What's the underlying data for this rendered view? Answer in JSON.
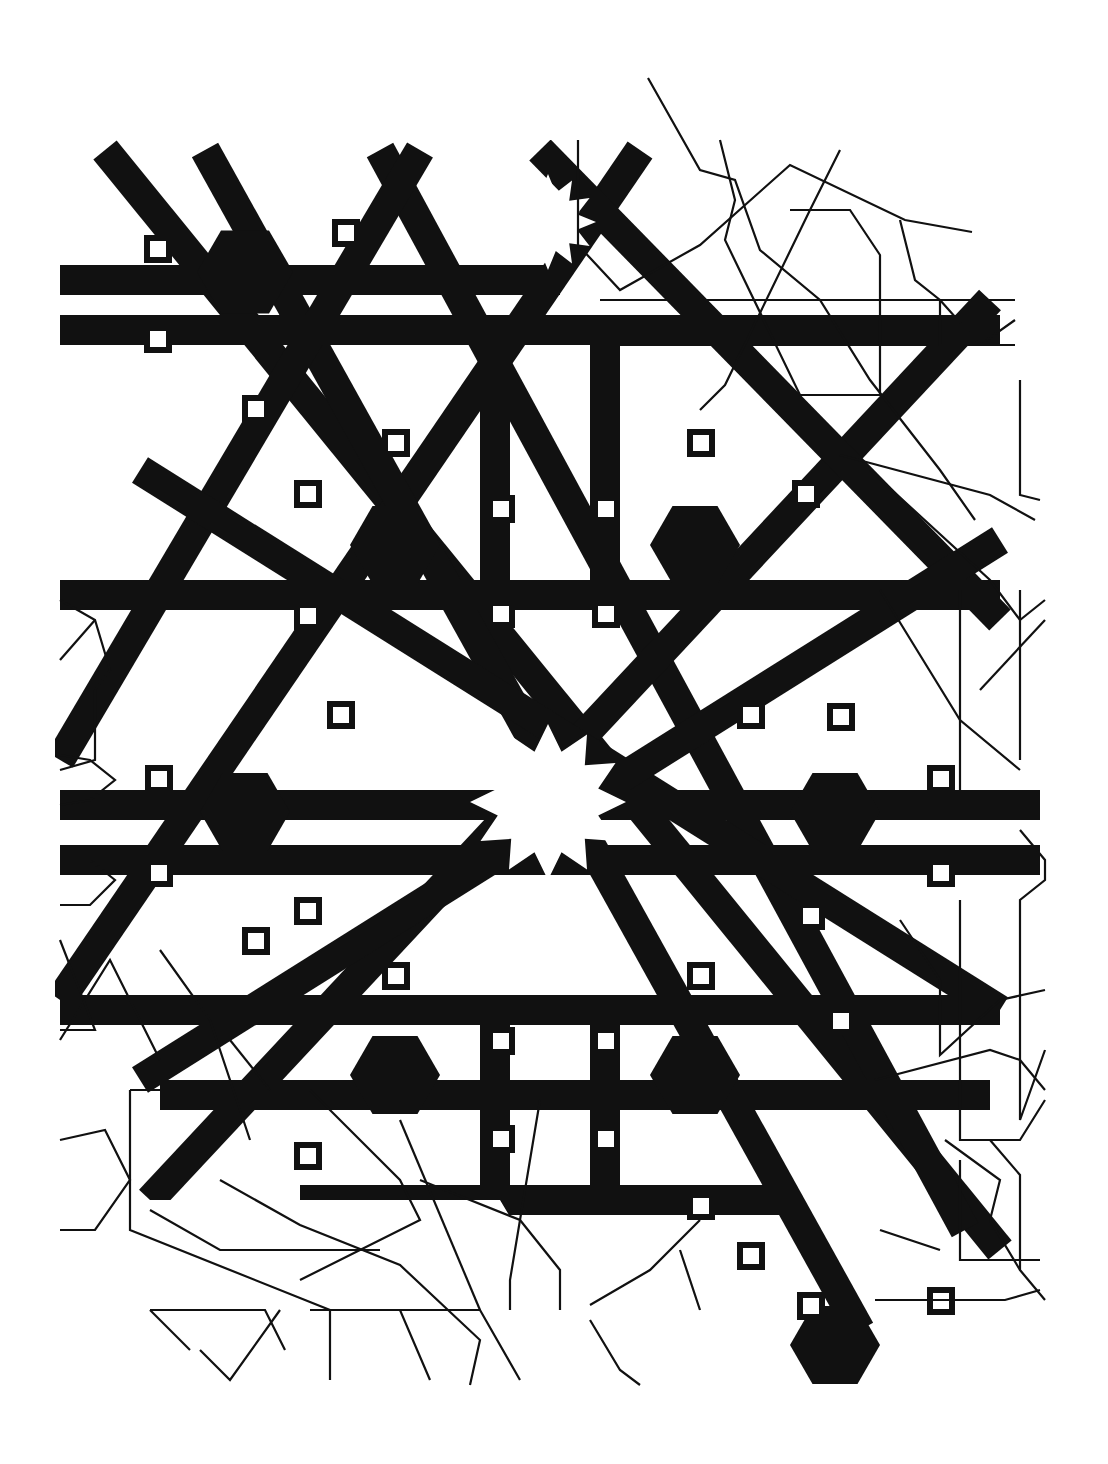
{
  "figure": {
    "title": "",
    "description": "Geometric Islamic star pattern: twelve-point star rosettes with interlaced bands (filled black) on the left/center, and outline construction linework on the right and bottom",
    "background": "#ffffff",
    "ink": "#111111",
    "line_width": 2.2
  },
  "pattern": {
    "rosettes": [
      {
        "cx": 548,
        "cy": 802,
        "r_outer": 78,
        "r_inner": 52,
        "points": 12,
        "style": "filled"
      },
      {
        "cx": 548,
        "cy": 222,
        "r_outer": 48,
        "r_inner": 30,
        "points": 12,
        "style": "white-star"
      }
    ],
    "hexagons": [
      {
        "cx": 245,
        "cy": 272,
        "r": 48
      },
      {
        "cx": 395,
        "cy": 545,
        "r": 45
      },
      {
        "cx": 695,
        "cy": 545,
        "r": 45
      },
      {
        "cx": 245,
        "cy": 812,
        "r": 45
      },
      {
        "cx": 835,
        "cy": 812,
        "r": 45
      },
      {
        "cx": 395,
        "cy": 1075,
        "r": 45
      },
      {
        "cx": 695,
        "cy": 1075,
        "r": 45
      },
      {
        "cx": 835,
        "cy": 1345,
        "r": 45
      }
    ],
    "squares": [
      {
        "x": 147,
        "y": 238
      },
      {
        "x": 147,
        "y": 328
      },
      {
        "x": 335,
        "y": 222
      },
      {
        "x": 245,
        "y": 398
      },
      {
        "x": 385,
        "y": 432
      },
      {
        "x": 297,
        "y": 483
      },
      {
        "x": 490,
        "y": 498
      },
      {
        "x": 595,
        "y": 498
      },
      {
        "x": 490,
        "y": 603
      },
      {
        "x": 595,
        "y": 603
      },
      {
        "x": 690,
        "y": 432
      },
      {
        "x": 795,
        "y": 483
      },
      {
        "x": 297,
        "y": 605
      },
      {
        "x": 330,
        "y": 704
      },
      {
        "x": 148,
        "y": 768
      },
      {
        "x": 148,
        "y": 862
      },
      {
        "x": 930,
        "y": 768
      },
      {
        "x": 930,
        "y": 862
      },
      {
        "x": 740,
        "y": 704
      },
      {
        "x": 830,
        "y": 706
      },
      {
        "x": 297,
        "y": 900
      },
      {
        "x": 385,
        "y": 965
      },
      {
        "x": 245,
        "y": 930
      },
      {
        "x": 690,
        "y": 965
      },
      {
        "x": 800,
        "y": 905
      },
      {
        "x": 830,
        "y": 1010
      },
      {
        "x": 490,
        "y": 1030
      },
      {
        "x": 595,
        "y": 1030
      },
      {
        "x": 490,
        "y": 1128
      },
      {
        "x": 595,
        "y": 1128
      },
      {
        "x": 297,
        "y": 1145
      },
      {
        "x": 690,
        "y": 1195
      },
      {
        "x": 740,
        "y": 1245
      },
      {
        "x": 800,
        "y": 1295
      },
      {
        "x": 930,
        "y": 1290
      }
    ],
    "bands": [
      [
        105,
        150,
        1000,
        1250
      ],
      [
        380,
        150,
        965,
        1230
      ],
      [
        150,
        1200,
        990,
        300
      ],
      [
        60,
        1000,
        640,
        150
      ],
      [
        205,
        150,
        860,
        1330
      ],
      [
        60,
        760,
        420,
        150
      ],
      [
        540,
        150,
        1000,
        620
      ],
      [
        140,
        470,
        1000,
        1010
      ],
      [
        140,
        1080,
        1000,
        540
      ],
      [
        60,
        595,
        1000,
        595
      ],
      [
        60,
        1010,
        1000,
        1010
      ],
      [
        60,
        280,
        560,
        280
      ],
      [
        60,
        330,
        1000,
        330
      ],
      [
        60,
        805,
        1040,
        805
      ],
      [
        60,
        860,
        1040,
        860
      ],
      [
        160,
        1095,
        990,
        1095
      ],
      [
        300,
        1200,
        780,
        1200
      ],
      [
        495,
        330,
        495,
        595
      ],
      [
        605,
        330,
        605,
        595
      ],
      [
        495,
        1010,
        495,
        1200
      ],
      [
        605,
        1010,
        605,
        1200
      ]
    ],
    "band_width": 30
  },
  "overlay": {
    "description": "outline construction lines (unfilled)",
    "polylines": [
      [
        [
          648,
          78
        ],
        [
          700,
          170
        ],
        [
          735,
          180
        ],
        [
          760,
          250
        ],
        [
          820,
          300
        ],
        [
          870,
          380
        ],
        [
          940,
          470
        ],
        [
          975,
          520
        ]
      ],
      [
        [
          578,
          140
        ],
        [
          578,
          245
        ],
        [
          620,
          290
        ],
        [
          700,
          245
        ],
        [
          790,
          165
        ],
        [
          905,
          220
        ],
        [
          972,
          232
        ]
      ],
      [
        [
          600,
          300
        ],
        [
          1015,
          300
        ]
      ],
      [
        [
          600,
          345
        ],
        [
          1015,
          345
        ]
      ],
      [
        [
          720,
          140
        ],
        [
          735,
          200
        ],
        [
          725,
          240
        ],
        [
          800,
          395
        ],
        [
          880,
          395
        ],
        [
          880,
          255
        ],
        [
          850,
          210
        ],
        [
          790,
          210
        ]
      ],
      [
        [
          840,
          150
        ],
        [
          810,
          210
        ],
        [
          725,
          385
        ],
        [
          700,
          410
        ]
      ],
      [
        [
          900,
          220
        ],
        [
          915,
          280
        ],
        [
          940,
          300
        ],
        [
          940,
          345
        ],
        [
          980,
          345
        ],
        [
          1015,
          320
        ]
      ],
      [
        [
          940,
          300
        ],
        [
          980,
          345
        ],
        [
          1015,
          345
        ]
      ],
      [
        [
          1020,
          380
        ],
        [
          1020,
          495
        ],
        [
          1040,
          500
        ]
      ],
      [
        [
          840,
          455
        ],
        [
          990,
          495
        ],
        [
          1035,
          520
        ]
      ],
      [
        [
          870,
          470
        ],
        [
          990,
          580
        ],
        [
          1020,
          620
        ],
        [
          1045,
          600
        ]
      ],
      [
        [
          1020,
          590
        ],
        [
          1020,
          760
        ]
      ],
      [
        [
          960,
          590
        ],
        [
          960,
          790
        ]
      ],
      [
        [
          860,
          590
        ],
        [
          940,
          590
        ]
      ],
      [
        [
          880,
          590
        ],
        [
          960,
          720
        ],
        [
          1020,
          770
        ]
      ],
      [
        [
          980,
          690
        ],
        [
          1045,
          620
        ]
      ],
      [
        [
          1020,
          830
        ],
        [
          1045,
          860
        ],
        [
          1045,
          880
        ],
        [
          1020,
          900
        ],
        [
          1020,
          1120
        ],
        [
          1045,
          1050
        ]
      ],
      [
        [
          960,
          900
        ],
        [
          960,
          1140
        ],
        [
          1020,
          1140
        ],
        [
          1045,
          1100
        ]
      ],
      [
        [
          900,
          920
        ],
        [
          940,
          980
        ],
        [
          940,
          1055
        ],
        [
          1000,
          1000
        ],
        [
          1045,
          990
        ]
      ],
      [
        [
          875,
          1080
        ],
        [
          990,
          1050
        ],
        [
          1020,
          1060
        ],
        [
          1045,
          1090
        ]
      ],
      [
        [
          990,
          1140
        ],
        [
          1020,
          1175
        ],
        [
          1020,
          1270
        ],
        [
          1045,
          1300
        ]
      ],
      [
        [
          945,
          1140
        ],
        [
          1000,
          1180
        ],
        [
          990,
          1220
        ],
        [
          1020,
          1270
        ]
      ],
      [
        [
          960,
          1160
        ],
        [
          960,
          1260
        ],
        [
          1040,
          1260
        ]
      ],
      [
        [
          875,
          1300
        ],
        [
          1005,
          1300
        ],
        [
          1040,
          1290
        ]
      ],
      [
        [
          60,
          600
        ],
        [
          95,
          620
        ],
        [
          110,
          670
        ],
        [
          95,
          690
        ],
        [
          95,
          760
        ],
        [
          60,
          770
        ]
      ],
      [
        [
          60,
          660
        ],
        [
          95,
          620
        ]
      ],
      [
        [
          60,
          755
        ],
        [
          90,
          760
        ],
        [
          115,
          780
        ],
        [
          90,
          800
        ],
        [
          60,
          805
        ]
      ],
      [
        [
          60,
          860
        ],
        [
          90,
          860
        ],
        [
          115,
          880
        ],
        [
          90,
          905
        ],
        [
          60,
          905
        ]
      ],
      [
        [
          60,
          940
        ],
        [
          95,
          1030
        ],
        [
          60,
          1030
        ]
      ],
      [
        [
          60,
          1140
        ],
        [
          105,
          1130
        ],
        [
          130,
          1180
        ],
        [
          95,
          1230
        ],
        [
          60,
          1230
        ]
      ],
      [
        [
          130,
          1090
        ],
        [
          310,
          1090
        ],
        [
          400,
          1180
        ],
        [
          420,
          1220
        ],
        [
          300,
          1280
        ]
      ],
      [
        [
          130,
          1090
        ],
        [
          130,
          1230
        ],
        [
          330,
          1310
        ],
        [
          330,
          1380
        ]
      ],
      [
        [
          150,
          1310
        ],
        [
          265,
          1310
        ],
        [
          285,
          1350
        ]
      ],
      [
        [
          150,
          1310
        ],
        [
          190,
          1350
        ]
      ],
      [
        [
          280,
          1310
        ],
        [
          230,
          1380
        ],
        [
          200,
          1350
        ]
      ],
      [
        [
          310,
          1310
        ],
        [
          400,
          1310
        ],
        [
          430,
          1380
        ]
      ],
      [
        [
          320,
          1310
        ],
        [
          480,
          1310
        ],
        [
          520,
          1380
        ]
      ],
      [
        [
          220,
          1180
        ],
        [
          300,
          1225
        ],
        [
          400,
          1265
        ],
        [
          480,
          1340
        ],
        [
          470,
          1385
        ]
      ],
      [
        [
          420,
          1180
        ],
        [
          520,
          1220
        ],
        [
          560,
          1270
        ],
        [
          560,
          1310
        ]
      ],
      [
        [
          590,
          1305
        ],
        [
          650,
          1270
        ],
        [
          700,
          1220
        ]
      ],
      [
        [
          590,
          1320
        ],
        [
          620,
          1370
        ],
        [
          640,
          1385
        ]
      ],
      [
        [
          540,
          1100
        ],
        [
          510,
          1280
        ],
        [
          510,
          1310
        ]
      ],
      [
        [
          150,
          1210
        ],
        [
          220,
          1250
        ],
        [
          380,
          1250
        ]
      ],
      [
        [
          160,
          950
        ],
        [
          210,
          1020
        ],
        [
          250,
          1140
        ]
      ],
      [
        [
          60,
          1040
        ],
        [
          110,
          960
        ],
        [
          160,
          1060
        ]
      ],
      [
        [
          230,
          1040
        ],
        [
          270,
          1090
        ]
      ],
      [
        [
          400,
          1120
        ],
        [
          480,
          1310
        ]
      ],
      [
        [
          680,
          1250
        ],
        [
          700,
          1310
        ]
      ],
      [
        [
          880,
          1230
        ],
        [
          940,
          1250
        ]
      ]
    ]
  }
}
